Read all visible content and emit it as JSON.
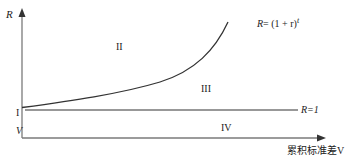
{
  "diagram": {
    "y_axis_label": "R",
    "x_axis_label": "累积标准差V",
    "curve_label": {
      "prefix": "R",
      "eq": "= (1 + r)",
      "exponent": "t"
    },
    "baseline_label": "R=1",
    "regions": {
      "I": "I",
      "II": "II",
      "III": "III",
      "IV": "IV",
      "V": "V"
    },
    "colors": {
      "axis": "#7a7a7a",
      "line": "#333333",
      "text": "#222222"
    }
  }
}
